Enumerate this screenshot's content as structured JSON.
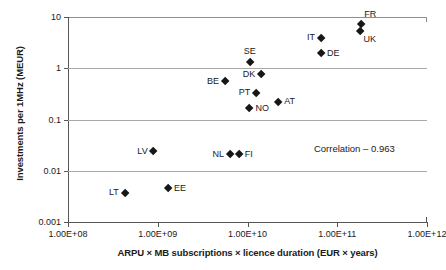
{
  "chart_data": {
    "type": "scatter",
    "title": "",
    "xlabel": "ARPU × MB subscriptions × licence duration (EUR × years)",
    "ylabel": "Investments per 1MHz (MEUR)",
    "xscale": "log",
    "yscale": "log",
    "xlim": [
      100000000,
      1000000000000
    ],
    "ylim": [
      0.001,
      10
    ],
    "xticks": [
      100000000,
      1000000000,
      10000000000,
      100000000000,
      1000000000000
    ],
    "xtick_labels": [
      "1.00E+08",
      "1.00E+09",
      "1.00E+10",
      "1.00E+11",
      "1.00E+12"
    ],
    "yticks": [
      10,
      1,
      0.1,
      0.01,
      0.001
    ],
    "ytick_labels": [
      "10",
      "1",
      "0.1",
      "0.01",
      "0.001"
    ],
    "grid": "horizontal",
    "legend": "none",
    "marker": "diamond",
    "marker_color": "#171717",
    "annotations": [
      {
        "text": "Correlation – 0.963",
        "x": 55000000000,
        "y": 0.028
      }
    ],
    "points": [
      {
        "label": "FR",
        "x": 185000000000.0,
        "y": 7.4,
        "label_pos": "tr"
      },
      {
        "label": "UK",
        "x": 182000000000.0,
        "y": 5.4,
        "label_pos": "br"
      },
      {
        "label": "IT",
        "x": 66000000000.0,
        "y": 3.9,
        "label_pos": "left"
      },
      {
        "label": "DE",
        "x": 66000000000.0,
        "y": 1.95,
        "label_pos": "right"
      },
      {
        "label": "SE",
        "x": 10600000000.0,
        "y": 1.32,
        "label_pos": "above"
      },
      {
        "label": "DK",
        "x": 14200000000.0,
        "y": 0.77,
        "label_pos": "left"
      },
      {
        "label": "BE",
        "x": 5600000000.0,
        "y": 0.55,
        "label_pos": "left"
      },
      {
        "label": "PT",
        "x": 12500000000.0,
        "y": 0.33,
        "label_pos": "left"
      },
      {
        "label": "AT",
        "x": 22000000000.0,
        "y": 0.22,
        "label_pos": "right"
      },
      {
        "label": "NO",
        "x": 10500000000.0,
        "y": 0.165,
        "label_pos": "right"
      },
      {
        "label": "LV",
        "x": 900000000.0,
        "y": 0.024,
        "label_pos": "left"
      },
      {
        "label": "NL",
        "x": 6400000000.0,
        "y": 0.021,
        "label_pos": "left"
      },
      {
        "label": "FI",
        "x": 8000000000.0,
        "y": 0.021,
        "label_pos": "right"
      },
      {
        "label": "EE",
        "x": 1300000000.0,
        "y": 0.0045,
        "label_pos": "right"
      },
      {
        "label": "LT",
        "x": 430000000.0,
        "y": 0.0037,
        "label_pos": "left"
      }
    ]
  }
}
